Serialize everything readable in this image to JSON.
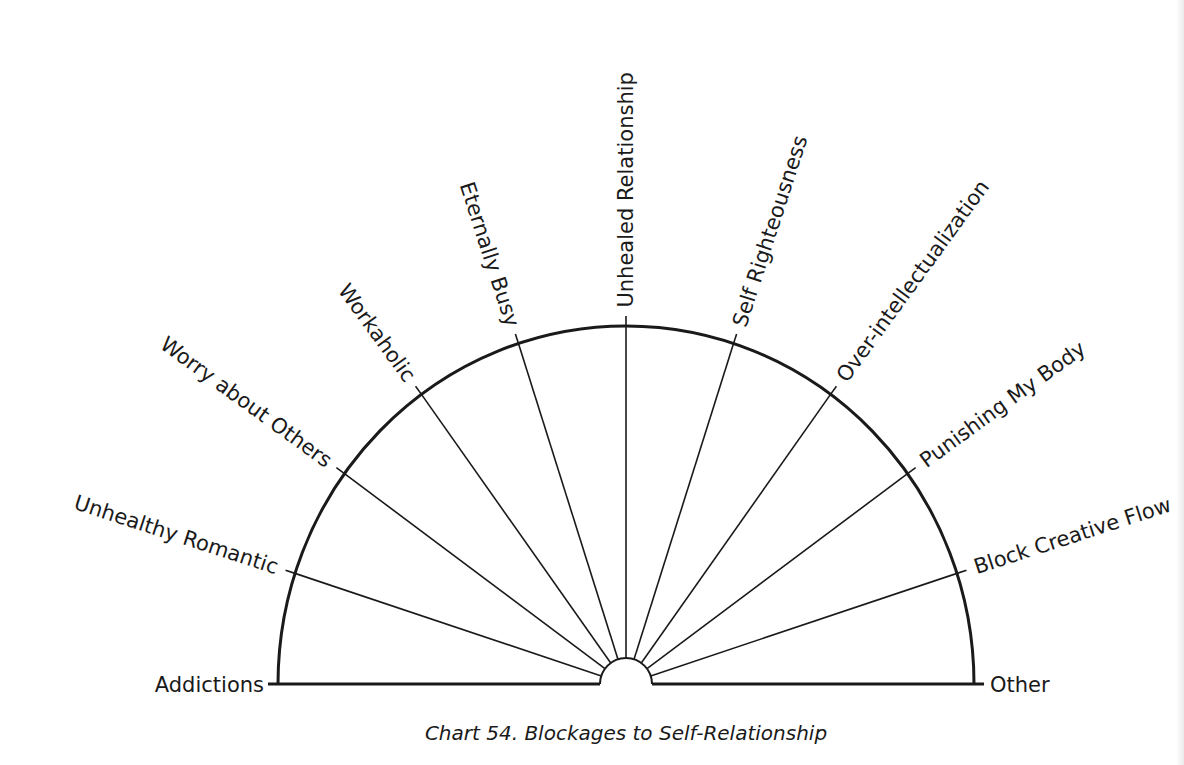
{
  "chart_data": {
    "type": "semicircle-pendulum-chart",
    "title": "Chart 54. Blockages to Self-Relationship",
    "categories": [
      "Addictions",
      "Unhealthy Romantic",
      "Worry about Others",
      "Workaholic",
      "Eternally Busy",
      "Unhealed Relationship",
      "Self Righteousness",
      "Over-intellectualization",
      "Punishing My Body",
      "Block Creative Flow",
      "Other"
    ],
    "spoke_angles_deg": [
      180,
      162,
      144,
      126,
      108,
      90,
      72,
      54,
      36,
      18,
      0
    ],
    "segments": 10,
    "geometry": {
      "center_x": 626,
      "center_y": 684,
      "radius_x": 348,
      "radius_y": 358,
      "inner_radius": 26,
      "tick_length": 10,
      "label_gap": 14
    },
    "colors": {
      "line": "#1a1a1a",
      "background": "#ffffff"
    }
  },
  "caption": "Chart 54. Blockages to Self-Relationship"
}
